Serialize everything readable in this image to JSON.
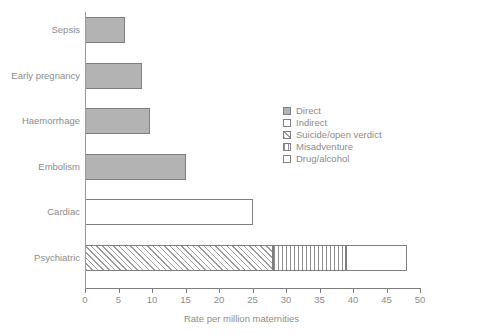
{
  "chart_data": {
    "type": "bar",
    "orientation": "horizontal",
    "title": "",
    "xlabel": "Rate per million maternities",
    "ylabel": "",
    "xlim": [
      0,
      50
    ],
    "xticks": [
      0,
      5,
      10,
      15,
      20,
      25,
      30,
      35,
      40,
      45,
      50
    ],
    "grid": false,
    "legend_position": "middle-right",
    "categories": [
      "Sepsis",
      "Early pregnancy",
      "Haemorrhage",
      "Embolism",
      "Cardiac",
      "Psychiatric"
    ],
    "series": [
      {
        "name": "Direct",
        "key": "direct",
        "values": [
          6,
          8.5,
          9.7,
          15,
          0,
          0
        ]
      },
      {
        "name": "Indirect",
        "key": "indirect",
        "values": [
          0,
          0,
          0,
          0,
          25,
          0
        ]
      },
      {
        "name": "Suicide/open verdict",
        "key": "suicide",
        "values": [
          0,
          0,
          0,
          0,
          0,
          28
        ]
      },
      {
        "name": "Misadventure",
        "key": "misadventure",
        "values": [
          0,
          0,
          0,
          0,
          0,
          11
        ]
      },
      {
        "name": "Drug/alcohol",
        "key": "drug",
        "values": [
          0,
          0,
          0,
          0,
          0,
          9
        ]
      }
    ],
    "totals": [
      6,
      8.5,
      9.7,
      15,
      25,
      48
    ],
    "colors": {
      "direct": "#b3b3b3",
      "indirect": "#ffffff",
      "suicide": "#ffffff",
      "misadventure": "#ffffff",
      "drug": "#ffffff",
      "outline": "#7f7f7f",
      "axis": "#7d7d7d",
      "text": "#8c8c8c"
    },
    "patterns": {
      "direct": "solid-gray",
      "indirect": "solid-white",
      "suicide": "diagonal-hatch",
      "misadventure": "vertical-lines",
      "drug": "solid-white"
    }
  },
  "legend": {
    "items": [
      {
        "label": "Direct",
        "pattern": "fill-direct"
      },
      {
        "label": "Indirect",
        "pattern": "fill-indirect"
      },
      {
        "label": "Suicide/open verdict",
        "pattern": "fill-suicide"
      },
      {
        "label": "Misadventure",
        "pattern": "fill-misadventure"
      },
      {
        "label": "Drug/alcohol",
        "pattern": "fill-drug"
      }
    ]
  }
}
